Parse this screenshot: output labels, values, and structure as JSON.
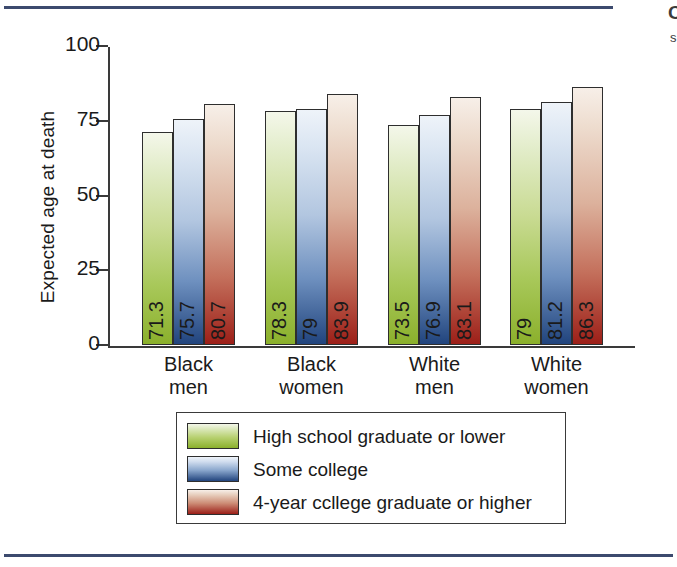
{
  "page": {
    "rule_color": "#3c4a6e",
    "margin_text_line1": "C",
    "margin_text_line2": "s"
  },
  "chart_data": {
    "type": "bar",
    "title": "",
    "subtitle": "",
    "xlabel": "",
    "ylabel": "Expected age at death",
    "ylim": [
      0,
      100
    ],
    "yticks": [
      "0",
      "25",
      "50",
      "75",
      "100"
    ],
    "grid": false,
    "legend_position": "bottom",
    "categories": [
      "Black men",
      "Black women",
      "White men",
      "White women"
    ],
    "category_lines": [
      {
        "line1": "Black",
        "line2": "men"
      },
      {
        "line1": "Black",
        "line2": "women"
      },
      {
        "line1": "White",
        "line2": "men"
      },
      {
        "line1": "White",
        "line2": "women"
      }
    ],
    "series": [
      {
        "name": "High school graduate or lower",
        "color": "#8bb02c",
        "values": [
          71.3,
          78.3,
          73.5,
          79
        ],
        "labels": [
          "71.3",
          "78.3",
          "73.5",
          "79"
        ]
      },
      {
        "name": "Some college",
        "color": "#21447d",
        "values": [
          75.7,
          79,
          76.9,
          81.2
        ],
        "labels": [
          "75.7",
          "79",
          "76.9",
          "81.2"
        ]
      },
      {
        "name": "4-year ccllege graduate or higher",
        "color": "#9c1f18",
        "values": [
          80.7,
          83.9,
          83.1,
          86.3
        ],
        "labels": [
          "80.7",
          "83.9",
          "83.1",
          "86.3"
        ]
      }
    ]
  }
}
